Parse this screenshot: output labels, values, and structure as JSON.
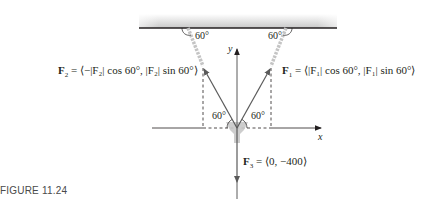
{
  "figure": {
    "caption": "FIGURE 11.24"
  },
  "labels": {
    "f1": "F₁ = ⟨|F₁| cos 60°, |F₁| sin 60°⟩",
    "f1_name": "F",
    "f1_sub": "1",
    "f1_rest": " = ⟨|F₁| cos 60°, |F₁| sin 60°⟩",
    "f2_name": "F",
    "f2_sub": "2",
    "f2_rest": " = ⟨−|F₂| cos 60°, |F₂| sin 60°⟩",
    "f3_name": "F",
    "f3_sub": "3",
    "f3_rest": " = ⟨0, −400⟩",
    "angle_top_left": "60°",
    "angle_top_right": "60°",
    "angle_bottom_left": "60°",
    "angle_bottom_right": "60°",
    "x_axis": "x",
    "y_axis": "y"
  },
  "colors": {
    "vector": "#5a5a5a",
    "ceiling_line": "#231f20",
    "dashed": "#231f20",
    "chain": "#bdbdbd"
  }
}
